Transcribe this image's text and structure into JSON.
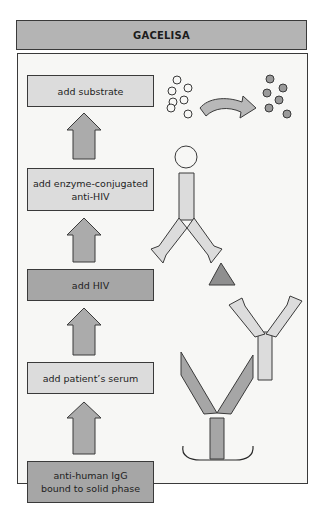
{
  "title": "GACELISA",
  "steps": [
    {
      "label": "add substrate",
      "line1": "add substrate",
      "line2": "",
      "shade": "light"
    },
    {
      "label": "add enzyme-conjugated anti-HIV",
      "line1": "add enzyme-conjugated",
      "line2": "anti-HIV",
      "shade": "light"
    },
    {
      "label": "add HIV",
      "line1": "add HIV",
      "line2": "",
      "shade": "dark"
    },
    {
      "label": "add patient's serum",
      "line1": "add patient’s serum",
      "line2": "",
      "shade": "light"
    },
    {
      "label": "anti-human IgG bound to solid phase",
      "line1": "anti-human IgG",
      "line2": "bound to solid phase",
      "shade": "dark"
    }
  ],
  "flow_direction": "bottom-to-top",
  "illustration": {
    "substrate": {
      "before": "colorless substrate circles (7)",
      "after": "colored product circles (7)",
      "arrow": "curved conversion arrow"
    },
    "enzyme_conjugated_antibody": "antibody with enzyme (circle) on stem",
    "antigen": "HIV (triangle)",
    "patient_antibody": "patient IgG (light Y)",
    "capture_antibody": "anti-human IgG (dark Y) on solid phase"
  },
  "colors": {
    "title_bg": "#b4b4b4",
    "panel_bg": "#f7f7f5",
    "light_fill": "#dcdcdc",
    "dark_fill": "#a6a6a6",
    "outline": "#3a3a3a"
  }
}
